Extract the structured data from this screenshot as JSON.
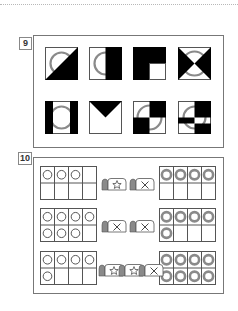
{
  "sections": [
    {
      "number": "9",
      "tiles": [
        {
          "id": "tile-1",
          "pattern": "diagonal-bottom-right-black-with-ring"
        },
        {
          "id": "tile-2",
          "pattern": "right-half-black-with-ring"
        },
        {
          "id": "tile-3",
          "pattern": "black-with-white-bottom-right-quarter"
        },
        {
          "id": "tile-4",
          "pattern": "hourglass-black-triangles-with-ring"
        },
        {
          "id": "tile-5",
          "pattern": "left-right-black-bars-with-ring"
        },
        {
          "id": "tile-6",
          "pattern": "black-top-triangle"
        },
        {
          "id": "tile-7",
          "pattern": "checker-quarters-with-ring"
        },
        {
          "id": "tile-8",
          "pattern": "offset-checker-with-ring"
        }
      ]
    },
    {
      "number": "10",
      "rows": [
        {
          "left_count": 3,
          "cards": [
            "star",
            "cross"
          ],
          "right_count": 4
        },
        {
          "left_count": 7,
          "cards": [
            "cross",
            "cross"
          ],
          "right_count": 5
        },
        {
          "left_count": 5,
          "cards": [
            "star",
            "star",
            "cross"
          ],
          "right_count": 8
        }
      ]
    }
  ],
  "colors": {
    "black": "#000000",
    "ring": "#8a8a8a",
    "line": "#555555",
    "frame": "#777777"
  }
}
